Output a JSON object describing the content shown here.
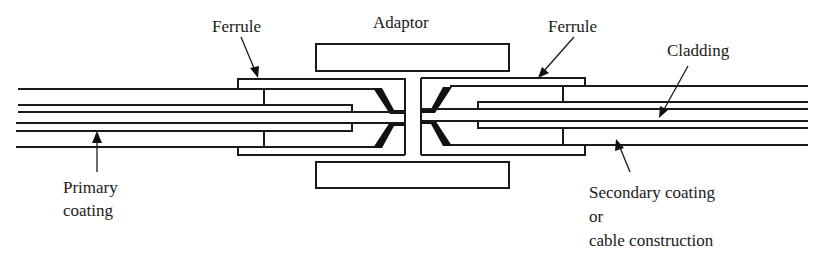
{
  "diagram": {
    "type": "optical fibre connector cross-section",
    "labels": {
      "ferrule_left": "Ferrule",
      "adaptor": "Adaptor",
      "ferrule_right": "Ferrule",
      "cladding": "Cladding",
      "primary_coating_line1": "Primary",
      "primary_coating_line2": "coating",
      "secondary_line1": "Secondary coating",
      "secondary_line2": "or",
      "secondary_line3": "cable construction"
    },
    "components": [
      "adaptor",
      "left-ferrule",
      "right-ferrule",
      "left-fibre",
      "right-fibre",
      "central-stop"
    ],
    "colors": {
      "ink": "#1a1a1a",
      "background": "#ffffff"
    }
  }
}
